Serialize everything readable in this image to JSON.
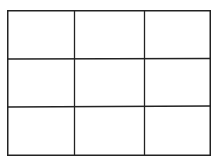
{
  "diagram": {
    "type": "grid",
    "rows": 3,
    "columns": 3,
    "line_color": "#222222",
    "background": "#ffffff",
    "cells": [
      [
        "",
        "",
        ""
      ],
      [
        "",
        "",
        ""
      ],
      [
        "",
        "",
        ""
      ]
    ]
  }
}
